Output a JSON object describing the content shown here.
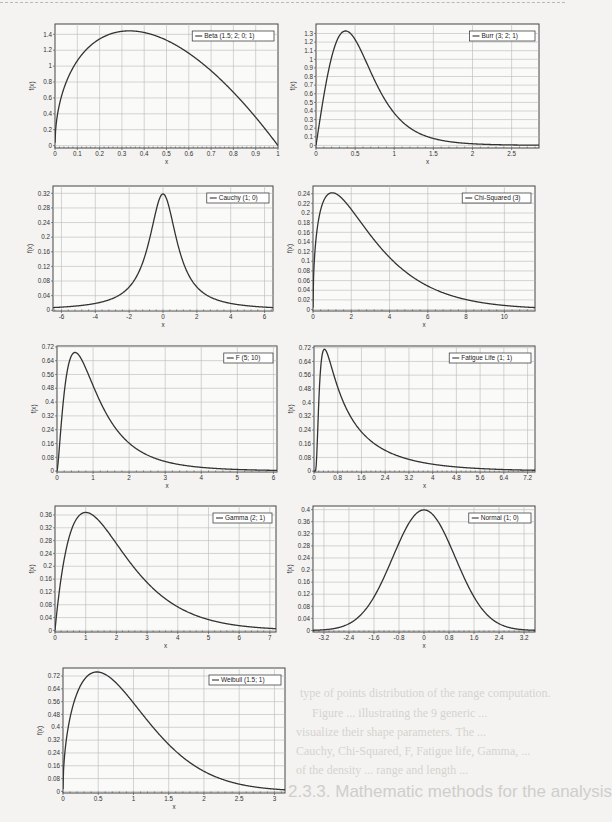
{
  "page": {
    "background_heading": "2.3.3. Mathematic methods for the analysis",
    "background_lines": [
      {
        "text": "type of points distribution of the range computation.",
        "x": 300,
        "y": 686
      },
      {
        "text": "Figure ... illustrating the 9 generic ...",
        "x": 312,
        "y": 706
      },
      {
        "text": "visualize their shape parameters. The ...",
        "x": 296,
        "y": 725
      },
      {
        "text": "Cauchy, Chi-Squared, F, Fatigue life, Gamma, ...",
        "x": 296,
        "y": 744
      },
      {
        "text": "of the density ... range and length ...",
        "x": 296,
        "y": 763
      }
    ]
  },
  "chart_data": [
    {
      "id": "beta",
      "type": "line",
      "legend": "Beta (1.5; 2; 0; 1)",
      "xlabel": "x",
      "ylabel": "f(x)",
      "xlim": [
        0,
        1
      ],
      "ylim": [
        -0.03,
        1.53
      ],
      "xticks": [
        0,
        0.1,
        0.2,
        0.3,
        0.4,
        0.5,
        0.6,
        0.7,
        0.8,
        0.9,
        1
      ],
      "yticks": [
        0,
        0.2,
        0.4,
        0.6,
        0.8,
        1,
        1.2,
        1.4
      ],
      "box": [
        55,
        24,
        223,
        124
      ],
      "dist": "beta",
      "params": {
        "a": 1.5,
        "b": 2
      },
      "peak": {
        "x": 0.33,
        "y": 1.45
      }
    },
    {
      "id": "burr",
      "type": "line",
      "legend": "Burr (3; 2; 1)",
      "xlabel": "x",
      "ylabel": "f(x)",
      "xlim": [
        0,
        2.85
      ],
      "ylim": [
        -0.03,
        1.41
      ],
      "xticks": [
        0,
        0.5,
        1,
        1.5,
        2,
        2.5
      ],
      "yticks": [
        0,
        0.1,
        0.2,
        0.3,
        0.4,
        0.5,
        0.6,
        0.7,
        0.8,
        0.9,
        1,
        1.1,
        1.2,
        1.3
      ],
      "box": [
        316,
        24,
        223,
        124
      ],
      "dist": "burr",
      "params": {
        "k": 3,
        "c": 2,
        "b": 1
      },
      "peak": {
        "x": 0.38,
        "y": 1.34
      }
    },
    {
      "id": "cauchy",
      "type": "line",
      "legend": "Cauchy (1; 0)",
      "xlabel": "x",
      "ylabel": "f(x)",
      "xlim": [
        -6.5,
        6.5
      ],
      "ylim": [
        -0.002,
        0.34
      ],
      "xticks": [
        -6,
        -4,
        -2,
        0,
        2,
        4,
        6
      ],
      "yticks": [
        0,
        0.04,
        0.08,
        0.12,
        0.16,
        0.2,
        0.24,
        0.28,
        0.32
      ],
      "box": [
        53,
        186,
        220,
        125
      ],
      "dist": "cauchy",
      "params": {
        "sigma": 1,
        "mu": 0
      },
      "peak": {
        "x": 0,
        "y": 0.318
      }
    },
    {
      "id": "chisq",
      "type": "line",
      "legend": "Chi-Squared (3)",
      "xlabel": "x",
      "ylabel": "f(x)",
      "xlim": [
        0,
        11.6
      ],
      "ylim": [
        -0.003,
        0.256
      ],
      "xticks": [
        0,
        2,
        4,
        6,
        8,
        10
      ],
      "yticks": [
        0,
        0.02,
        0.04,
        0.06,
        0.08,
        0.1,
        0.12,
        0.14,
        0.16,
        0.18,
        0.2,
        0.22,
        0.24
      ],
      "box": [
        313,
        186,
        222,
        125
      ],
      "dist": "chisq",
      "params": {
        "nu": 3
      },
      "peak": {
        "x": 1,
        "y": 0.242
      }
    },
    {
      "id": "f",
      "type": "line",
      "legend": "F (5; 10)",
      "xlabel": "x",
      "ylabel": "f(x)",
      "xlim": [
        0,
        6.1
      ],
      "ylim": [
        -0.005,
        0.725
      ],
      "xticks": [
        0,
        1,
        2,
        3,
        4,
        5,
        6
      ],
      "yticks": [
        0,
        0.08,
        0.16,
        0.24,
        0.32,
        0.4,
        0.48,
        0.56,
        0.64,
        0.72
      ],
      "box": [
        57,
        346,
        220,
        126
      ],
      "dist": "f",
      "params": {
        "d1": 5,
        "d2": 10
      },
      "peak": {
        "x": 0.5,
        "y": 0.69
      }
    },
    {
      "id": "fatigue",
      "type": "line",
      "legend": "Fatigue Life (1; 1)",
      "xlabel": "x",
      "ylabel": "f(x)",
      "xlim": [
        0,
        7.45
      ],
      "ylim": [
        -0.005,
        0.73
      ],
      "xticks": [
        0,
        0.8,
        1.6,
        2.4,
        3.2,
        4,
        4.8,
        5.6,
        6.4,
        7.2
      ],
      "yticks": [
        0,
        0.08,
        0.16,
        0.24,
        0.32,
        0.4,
        0.48,
        0.56,
        0.64,
        0.72
      ],
      "box": [
        314,
        346,
        221,
        126
      ],
      "dist": "fatigue",
      "params": {
        "alpha": 1,
        "beta": 1
      },
      "peak": {
        "x": 0.33,
        "y": 0.71
      }
    },
    {
      "id": "gamma",
      "type": "line",
      "legend": "Gamma (2; 1)",
      "xlabel": "x",
      "ylabel": "f(x)",
      "xlim": [
        0,
        7.2
      ],
      "ylim": [
        -0.005,
        0.388
      ],
      "xticks": [
        0,
        1,
        2,
        3,
        4,
        5,
        6,
        7
      ],
      "yticks": [
        0,
        0.04,
        0.08,
        0.12,
        0.16,
        0.2,
        0.24,
        0.28,
        0.32,
        0.36
      ],
      "box": [
        55,
        506,
        221,
        126
      ],
      "dist": "gamma",
      "params": {
        "alpha": 2,
        "beta": 1
      },
      "peak": {
        "x": 1,
        "y": 0.368
      }
    },
    {
      "id": "normal",
      "type": "line",
      "legend": "Normal (1; 0)",
      "xlabel": "x",
      "ylabel": "f(x)",
      "xlim": [
        -3.55,
        3.55
      ],
      "ylim": [
        -0.005,
        0.412
      ],
      "xticks": [
        -3.2,
        -2.4,
        -1.6,
        -0.8,
        0,
        0.8,
        1.6,
        2.4,
        3.2
      ],
      "yticks": [
        0,
        0.04,
        0.08,
        0.12,
        0.16,
        0.2,
        0.24,
        0.28,
        0.32,
        0.36,
        0.4
      ],
      "box": [
        313,
        506,
        222,
        126
      ],
      "dist": "normal",
      "params": {
        "sigma": 1,
        "mu": 0
      },
      "peak": {
        "x": 0,
        "y": 0.399
      }
    },
    {
      "id": "weibull",
      "type": "line",
      "legend": "Weibull (1.5; 1)",
      "xlabel": "x",
      "ylabel": "f(x)",
      "xlim": [
        0,
        3.15
      ],
      "ylim": [
        -0.01,
        0.77
      ],
      "xticks": [
        0,
        0.5,
        1,
        1.5,
        2,
        2.5,
        3
      ],
      "yticks": [
        0,
        0.08,
        0.16,
        0.24,
        0.32,
        0.4,
        0.48,
        0.56,
        0.64,
        0.72
      ],
      "box": [
        63,
        668,
        222,
        125
      ],
      "dist": "weibull",
      "params": {
        "alpha": 1.5,
        "beta": 1
      },
      "peak": {
        "x": 0.48,
        "y": 0.75
      }
    }
  ]
}
